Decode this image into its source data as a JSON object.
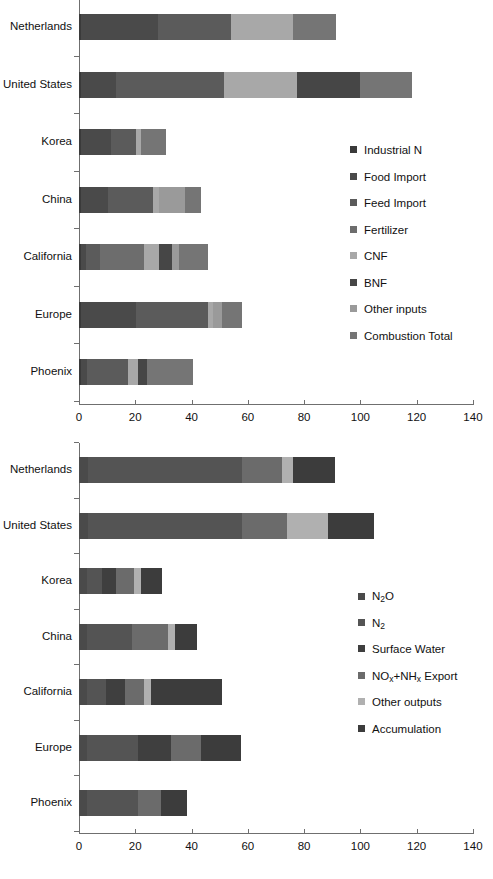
{
  "chart_data": [
    {
      "type": "bar",
      "orientation": "horizontal",
      "stacked": true,
      "title": "",
      "xlabel": "",
      "ylabel": "",
      "xlim": [
        0,
        140
      ],
      "xticks": [
        0,
        20,
        40,
        60,
        80,
        100,
        120,
        140
      ],
      "xtick_labels": [
        "0",
        "20",
        "40",
        "60",
        "80",
        "100",
        "120",
        "140"
      ],
      "grid": false,
      "legend_position": "right-middle",
      "categories": [
        "Netherlands",
        "United States",
        "Korea",
        "China",
        "California",
        "Europe",
        "Phoenix"
      ],
      "series": [
        {
          "name": "Industrial N",
          "color": "#3a3a3a",
          "values": [
            0.6,
            0.6,
            0.6,
            0.6,
            0.8,
            0.6,
            0.6
          ]
        },
        {
          "name": "Food Import",
          "color": "#4a4a4a",
          "values": [
            27.5,
            12.7,
            10.7,
            9.7,
            1.6,
            19.8,
            2.4
          ]
        },
        {
          "name": "Feed Import",
          "color": "#5b5b5b",
          "values": [
            26.0,
            38.2,
            9.1,
            16.0,
            5.2,
            25.5,
            14.4
          ]
        },
        {
          "name": "Fertilizer",
          "color": "#6d6d6d",
          "values": [
            0.0,
            0.0,
            0.0,
            0.0,
            15.4,
            0.0,
            0.0
          ]
        },
        {
          "name": "CNF",
          "color": "#a8a8a8",
          "values": [
            22.0,
            25.8,
            1.8,
            2.2,
            5.3,
            1.8,
            3.6
          ]
        },
        {
          "name": "BNF",
          "color": "#464646",
          "values": [
            0.0,
            22.6,
            0.0,
            0.0,
            4.7,
            0.0,
            3.0
          ]
        },
        {
          "name": "Other inputs",
          "color": "#9a9a9a",
          "values": [
            0.0,
            0.0,
            0.0,
            9.1,
            2.4,
            3.2,
            0.0
          ]
        },
        {
          "name": "Combustion Total",
          "color": "#757575",
          "values": [
            15.4,
            18.4,
            8.9,
            5.7,
            10.5,
            6.9,
            16.6
          ]
        }
      ],
      "totals": [
        91.5,
        118.3,
        31.1,
        43.3,
        45.9,
        57.8,
        40.6
      ]
    },
    {
      "type": "bar",
      "orientation": "horizontal",
      "stacked": true,
      "title": "",
      "xlabel": "",
      "ylabel": "",
      "xlim": [
        0,
        140
      ],
      "xticks": [
        0,
        20,
        40,
        60,
        80,
        100,
        120,
        140
      ],
      "xtick_labels": [
        "0",
        "20",
        "40",
        "60",
        "80",
        "100",
        "120",
        "140"
      ],
      "grid": false,
      "legend_position": "right-middle",
      "categories": [
        "Netherlands",
        "United States",
        "Korea",
        "China",
        "California",
        "Europe",
        "Phoenix"
      ],
      "series": [
        {
          "name": "N2O",
          "label": "N<sub>2</sub>O",
          "color": "#4a4a4a",
          "values": [
            3.2,
            3.2,
            3.0,
            3.0,
            3.0,
            3.0,
            3.0
          ]
        },
        {
          "name": "N2",
          "label": "N<sub>2</sub>",
          "color": "#545454",
          "values": [
            54.6,
            54.6,
            5.0,
            16.0,
            6.5,
            18.0,
            18.0
          ]
        },
        {
          "name": "Surface Water",
          "label": "Surface Water",
          "color": "#3f3f3f",
          "values": [
            0.0,
            0.0,
            5.0,
            0.0,
            7.0,
            11.8,
            0.0
          ]
        },
        {
          "name": "NOx+NHx Export",
          "label": "NO<sub>x</sub>+NH<sub>x</sub> Export",
          "color": "#6b6b6b",
          "values": [
            14.2,
            16.0,
            6.5,
            12.5,
            6.5,
            10.5,
            8.0
          ]
        },
        {
          "name": "Other outputs",
          "label": "Other outputs",
          "color": "#b0b0b0",
          "values": [
            4.2,
            14.8,
            2.4,
            2.5,
            2.5,
            0.0,
            0.0
          ]
        },
        {
          "name": "Accumulation",
          "label": "Accumulation",
          "color": "#3c3c3c",
          "values": [
            14.8,
            16.2,
            7.5,
            8.0,
            25.2,
            14.2,
            9.5
          ]
        }
      ],
      "totals": [
        91.0,
        120.8,
        29.4,
        42.0,
        50.7,
        57.5,
        38.5
      ]
    }
  ],
  "panels": [
    {
      "id": "top",
      "legend_title": "",
      "legend": [
        "Industrial N",
        "Food Import",
        "Feed Import",
        "Fertilizer",
        "CNF",
        "BNF",
        "Other inputs",
        "Combustion Total"
      ]
    },
    {
      "id": "bottom",
      "legend_title": "",
      "legend": [
        "N2O",
        "N2",
        "Surface Water",
        "NOx+NHx Export",
        "Other outputs",
        "Accumulation"
      ]
    }
  ]
}
